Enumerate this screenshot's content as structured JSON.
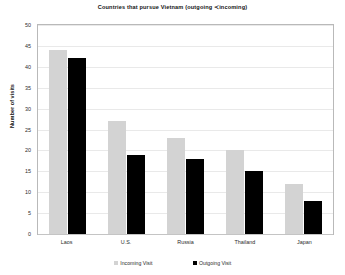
{
  "chart_data": {
    "type": "bar",
    "title": "Countries that pursue Vietnam (outgoing ≺incoming)",
    "xlabel": "",
    "ylabel": "Number of visits",
    "categories": [
      "Laos",
      "U.S.",
      "Russia",
      "Thailand",
      "Japan"
    ],
    "series": [
      {
        "name": "Incoming Visit",
        "color": "#d3d3d3",
        "values": [
          44,
          27,
          23,
          20,
          12
        ]
      },
      {
        "name": "Outgoing Visit",
        "color": "#000000",
        "values": [
          42,
          19,
          18,
          15,
          8
        ]
      }
    ],
    "ylim": [
      0,
      50
    ],
    "ytick_step": 5,
    "yticks": [
      50,
      45,
      40,
      35,
      30,
      25,
      20,
      15,
      10,
      5,
      0
    ],
    "grid": "horizontal",
    "legend_position": "bottom-center"
  },
  "axes": {
    "y_title": "Number of visits"
  },
  "legend": {
    "entries": [
      {
        "label": "Incoming Visit",
        "swatch": "incoming"
      },
      {
        "label": "Outgoing Visit",
        "swatch": "outgoing"
      }
    ]
  }
}
